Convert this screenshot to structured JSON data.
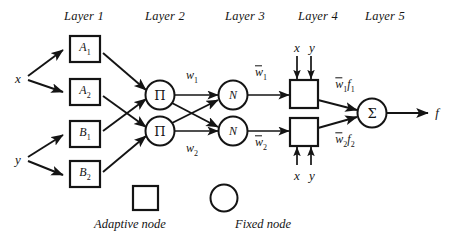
{
  "figure": {
    "type": "neural-fuzzy-network-diagram",
    "background_color": "#ffffff",
    "stroke_color": "#141414"
  },
  "layer_headers": [
    {
      "label": "Layer 1",
      "x": 84,
      "y": 16
    },
    {
      "label": "Layer 2",
      "x": 165,
      "y": 16
    },
    {
      "label": "Layer 3",
      "x": 245,
      "y": 16
    },
    {
      "label": "Layer 4",
      "x": 318,
      "y": 16
    },
    {
      "label": "Layer 5",
      "x": 385,
      "y": 16
    }
  ],
  "inputs": [
    {
      "name": "input-x",
      "label": "x",
      "x": 18,
      "y": 78
    },
    {
      "name": "input-y",
      "label": "y",
      "x": 18,
      "y": 159
    }
  ],
  "output": {
    "name": "output-f",
    "label": "f",
    "x": 437,
    "y": 112
  },
  "layer1_nodes": [
    {
      "id": "A1",
      "base": "A",
      "sub": "1",
      "shape": "square",
      "cx": 85,
      "cy": 49
    },
    {
      "id": "A2",
      "base": "A",
      "sub": "2",
      "shape": "square",
      "cx": 85,
      "cy": 92
    },
    {
      "id": "B1",
      "base": "B",
      "sub": "1",
      "shape": "square",
      "cx": 85,
      "cy": 134
    },
    {
      "id": "B2",
      "base": "B",
      "sub": "2",
      "shape": "square",
      "cx": 85,
      "cy": 174
    }
  ],
  "layer2_nodes": [
    {
      "id": "PI1",
      "label": "Π",
      "shape": "circle",
      "cx": 160,
      "cy": 95
    },
    {
      "id": "PI2",
      "label": "Π",
      "shape": "circle",
      "cx": 160,
      "cy": 131
    }
  ],
  "layer3_nodes": [
    {
      "id": "N1",
      "label": "N",
      "shape": "circle",
      "cx": 233,
      "cy": 95
    },
    {
      "id": "N2",
      "label": "N",
      "shape": "circle",
      "cx": 233,
      "cy": 131
    }
  ],
  "layer4_nodes": [
    {
      "id": "F1",
      "shape": "square",
      "cx": 304,
      "cy": 94
    },
    {
      "id": "F2",
      "shape": "square",
      "cx": 304,
      "cy": 132
    }
  ],
  "layer5_node": {
    "id": "SUM",
    "label": "Σ",
    "shape": "circle",
    "cx": 372,
    "cy": 113
  },
  "signal_labels": [
    {
      "name": "weight-w1",
      "base": "w",
      "sub": "1",
      "overbar": false,
      "x": 192,
      "y": 77
    },
    {
      "name": "weight-w2",
      "base": "w",
      "sub": "2",
      "overbar": false,
      "x": 192,
      "y": 150
    },
    {
      "name": "normalized-weight-w1",
      "base": "w",
      "sub": "1",
      "overbar": true,
      "x": 261,
      "y": 74
    },
    {
      "name": "normalized-weight-w2",
      "base": "w",
      "sub": "2",
      "overbar": true,
      "x": 261,
      "y": 144
    },
    {
      "name": "consequent-w1f1",
      "base": "w",
      "sub": "1",
      "overbar": true,
      "suffix_base": "f",
      "suffix_sub": "1",
      "x": 328,
      "y": 86
    },
    {
      "name": "consequent-w2f2",
      "base": "w",
      "sub": "2",
      "overbar": true,
      "suffix_base": "f",
      "suffix_sub": "2",
      "x": 328,
      "y": 141
    }
  ],
  "layer4_inputs": [
    {
      "name": "layer4-top-inputs",
      "labels": [
        "x",
        "y"
      ],
      "x": 304,
      "y": 47,
      "direction": "down"
    },
    {
      "name": "layer4-bottom-inputs",
      "labels": [
        "x",
        "y"
      ],
      "x": 304,
      "y": 173,
      "direction": "up"
    }
  ],
  "legend": {
    "items": [
      {
        "name": "legend-adaptive-node",
        "shape": "square",
        "label": "Adaptive node",
        "shape_cx": 146,
        "shape_cy": 198,
        "label_x": 130,
        "label_y": 224
      },
      {
        "name": "legend-fixed-node",
        "shape": "circle",
        "label": "Fixed node",
        "shape_cx": 224,
        "shape_cy": 198,
        "label_x": 263,
        "label_y": 224
      }
    ]
  }
}
